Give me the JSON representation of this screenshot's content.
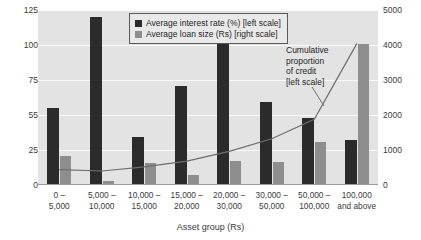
{
  "chart_data": {
    "type": "bar",
    "title": "",
    "xlabel": "Asset group (Rs)",
    "ylabel": "",
    "categories": [
      "0 –\n5,000",
      "5,000 –\n10,000",
      "10,000 –\n15,000",
      "15,000 –\n20,000",
      "20,000 –\n30,000",
      "30,000 –\n50,000",
      "50,000 –\n100,000",
      "100,000\nand above"
    ],
    "category_lines": [
      [
        "0 –",
        "5,000"
      ],
      [
        "5,000 –",
        "10,000"
      ],
      [
        "10,000 –",
        "15,000"
      ],
      [
        "15,000 –",
        "20,000"
      ],
      [
        "20,000 –",
        "30,000"
      ],
      [
        "30,000 –",
        "50,000"
      ],
      [
        "50,000 –",
        "100,000"
      ],
      [
        "100,000",
        "and above"
      ]
    ],
    "series": [
      {
        "name": "Average interest rate (%) [left scale]",
        "axis": "left",
        "type": "bar",
        "color": "#2b2b2b",
        "values": [
          55,
          120,
          34,
          71,
          103,
          59,
          48,
          32
        ]
      },
      {
        "name": "Average loan size (Rs) [right scale]",
        "axis": "right",
        "type": "bar",
        "color": "#8e8e8e",
        "values": [
          820,
          110,
          640,
          280,
          680,
          660,
          1220,
          4030
        ]
      },
      {
        "name": "Cumulative proportion of credit [left scale]",
        "axis": "left",
        "type": "line",
        "color": "#6e6e6e",
        "values": [
          11,
          10,
          13,
          17,
          24,
          33,
          47,
          101
        ]
      }
    ],
    "left_axis": {
      "ticks": [
        0,
        25,
        55,
        75,
        100,
        125
      ],
      "ylim": [
        0,
        125
      ],
      "label": ""
    },
    "right_axis": {
      "ticks": [
        0,
        1000,
        2000,
        3000,
        4000,
        5000
      ],
      "ylim": [
        0,
        5000
      ],
      "label": ""
    },
    "grid": true,
    "legend_position": "top-center",
    "annotations": [
      {
        "name": "cumulative-proportion-annotation",
        "lines": [
          "Cumulative",
          "proportion",
          "of credit",
          "[left scale]"
        ]
      }
    ]
  },
  "legend": {
    "items": [
      {
        "label": "Average interest rate (%) [left scale]",
        "color": "#2b2b2b"
      },
      {
        "label": "Average loan size (Rs) [right scale]",
        "color": "#8e8e8e"
      }
    ]
  },
  "annotation": {
    "line1": "Cumulative",
    "line2": "proportion",
    "line3": "of credit",
    "line4": "[left scale]"
  },
  "axes": {
    "x_title": "Asset group (Rs)",
    "left_ticks": [
      "125",
      "100",
      "75",
      "55",
      "25",
      "0"
    ],
    "right_ticks": [
      "5000",
      "4000",
      "3000",
      "2000",
      "1000",
      "0"
    ]
  },
  "colors": {
    "plot_background": "#e3e3e3",
    "gridline": "#fafafa",
    "bar_dark": "#2b2b2b",
    "bar_gray": "#8e8e8e",
    "line": "#6e6e6e",
    "text": "#2b2b2b"
  }
}
